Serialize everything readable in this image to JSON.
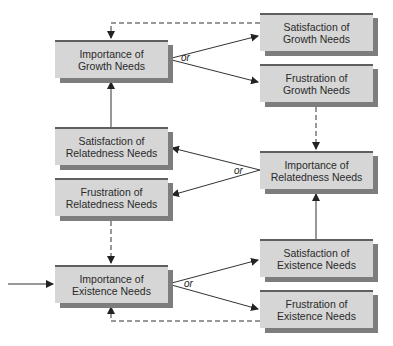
{
  "diagram": {
    "type": "ERG theory frustration-regression flow diagram",
    "connector_label": "or",
    "nodes": {
      "importance_growth": {
        "line1": "Importance of",
        "line2": "Growth Needs"
      },
      "satisfaction_growth": {
        "line1": "Satisfaction of",
        "line2": "Growth Needs"
      },
      "frustration_growth": {
        "line1": "Frustration of",
        "line2": "Growth Needs"
      },
      "satisfaction_relatedness": {
        "line1": "Satisfaction of",
        "line2": "Relatedness Needs"
      },
      "frustration_relatedness": {
        "line1": "Frustration of",
        "line2": "Relatedness Needs"
      },
      "importance_relatedness": {
        "line1": "Importance of",
        "line2": "Relatedness Needs"
      },
      "importance_existence": {
        "line1": "Importance of",
        "line2": "Existence Needs"
      },
      "satisfaction_existence": {
        "line1": "Satisfaction of",
        "line2": "Existence Needs"
      },
      "frustration_existence": {
        "line1": "Frustration of",
        "line2": "Existence Needs"
      }
    },
    "or_labels": {
      "growth": "or",
      "relatedness": "or",
      "existence": "or"
    },
    "colors": {
      "box_fill": "#d6d6d6",
      "box_shadow": "#7d7d7d",
      "box_top_border": "#5f5f5f",
      "line": "#333333"
    }
  }
}
